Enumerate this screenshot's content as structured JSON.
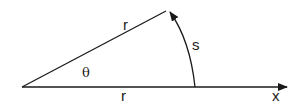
{
  "diagram": {
    "labels": {
      "upper_radius": "r",
      "lower_radius": "r",
      "arc": "s",
      "angle": "θ",
      "axis": "x"
    },
    "colors": {
      "stroke": "#1a1a1a",
      "background": "#ffffff"
    }
  }
}
